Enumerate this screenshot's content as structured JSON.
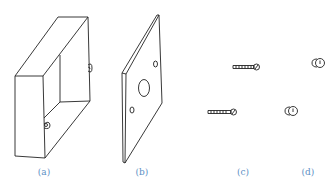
{
  "figure": {
    "line_color": "#222222",
    "label_color": "#5b8fc4",
    "parts": [
      {
        "id": "a",
        "label": "(a)",
        "description": "open rectangular box",
        "label_x": 44
      },
      {
        "id": "b",
        "label": "(b)",
        "description": "flat plate with three holes",
        "label_x": 142
      },
      {
        "id": "c",
        "label": "(c)",
        "description": "two screws",
        "label_x": 243
      },
      {
        "id": "d",
        "label": "(d)",
        "description": "two nuts",
        "label_x": 308
      }
    ]
  }
}
